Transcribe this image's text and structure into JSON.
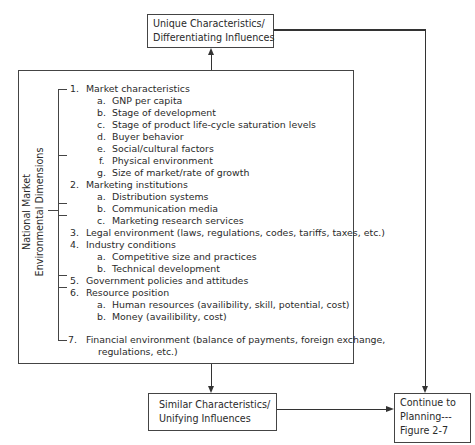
{
  "top_box": {
    "line1": "Unique Characteristics/",
    "line2": "Differentiating Influences"
  },
  "bottom_box": {
    "line1": "Similar Characteristics/",
    "line2": "Unifying Influences"
  },
  "continue_box": {
    "line1": "Continue to",
    "line2": "Planning---",
    "line3": "Figure 2-7"
  },
  "side_label": {
    "line1": "National Market",
    "line2": "Environmental Dimensions"
  },
  "dimensions": [
    {
      "number": "1.",
      "label": "Market characteristics",
      "sub": [
        {
          "letter": "a.",
          "label": "GNP per capita"
        },
        {
          "letter": "b.",
          "label": "Stage of development"
        },
        {
          "letter": "c.",
          "label": "Stage of product life-cycle saturation levels"
        },
        {
          "letter": "d.",
          "label": "Buyer behavior"
        },
        {
          "letter": "e.",
          "label": "Social/cultural factors"
        },
        {
          "letter": "f.",
          "label": "Physical environment"
        },
        {
          "letter": "g.",
          "label": "Size of market/rate of growth"
        }
      ]
    },
    {
      "number": "2.",
      "label": "Marketing institutions",
      "sub": [
        {
          "letter": "a.",
          "label": "Distribution systems"
        },
        {
          "letter": "b.",
          "label": "Communication media"
        },
        {
          "letter": "c.",
          "label": "Marketing research services"
        }
      ]
    },
    {
      "number": "3.",
      "label": "Legal environment (laws, regulations, codes, tariffs, taxes, etc.)",
      "sub": []
    },
    {
      "number": "4.",
      "label": "Industry conditions",
      "sub": [
        {
          "letter": "a.",
          "label": "Competitive size and practices"
        },
        {
          "letter": "b.",
          "label": "Technical development"
        }
      ]
    },
    {
      "number": "5.",
      "label": "Government policies and attitudes",
      "sub": []
    },
    {
      "number": "6.",
      "label": "Resource position",
      "sub": [
        {
          "letter": "a.",
          "label": "Human resources (availibility, skill, potential, cost)"
        },
        {
          "letter": "b.",
          "label": "Money (availibility, cost)"
        }
      ]
    },
    {
      "number": "7.",
      "label": "Financial environment (balance of payments, foreign exchange,",
      "continuation": "regulations, etc.)",
      "sub": []
    }
  ]
}
